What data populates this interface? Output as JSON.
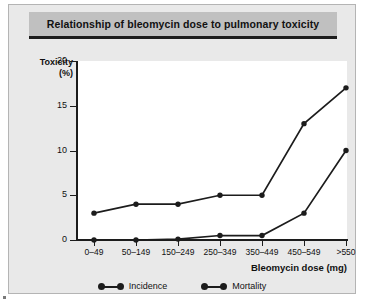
{
  "figure": {
    "title": "Relationship of bleomycin dose to pulmonary toxicity",
    "background_color": "#e9e9e9",
    "title_bar_color": "#c0c0c0",
    "plot_background_color": "#ffffff",
    "line_color": "#1c1c1c"
  },
  "axes": {
    "y_title_line1": "Toxicity",
    "y_title_line2": "(%)",
    "x_title": "Bleomycin dose (mg)"
  },
  "legend": {
    "items": [
      {
        "label": "Incidence"
      },
      {
        "label": "Mortality"
      }
    ]
  },
  "chart_data": {
    "type": "line",
    "title": "Relationship of bleomycin dose to pulmonary toxicity",
    "xlabel": "Bleomycin dose (mg)",
    "ylabel": "Toxicity (%)",
    "categories": [
      "0–49",
      "50–149",
      "150–249",
      "250–349",
      "350–449",
      "450–549",
      ">550"
    ],
    "yticks": [
      0,
      5,
      10,
      15,
      20
    ],
    "ylim": [
      0,
      20
    ],
    "grid": false,
    "legend_position": "bottom-center",
    "series": [
      {
        "name": "Incidence",
        "values": [
          3,
          4,
          4,
          5,
          5,
          13,
          17
        ]
      },
      {
        "name": "Mortality",
        "values": [
          0,
          0,
          0.1,
          0.5,
          0.5,
          3,
          10
        ]
      }
    ]
  }
}
